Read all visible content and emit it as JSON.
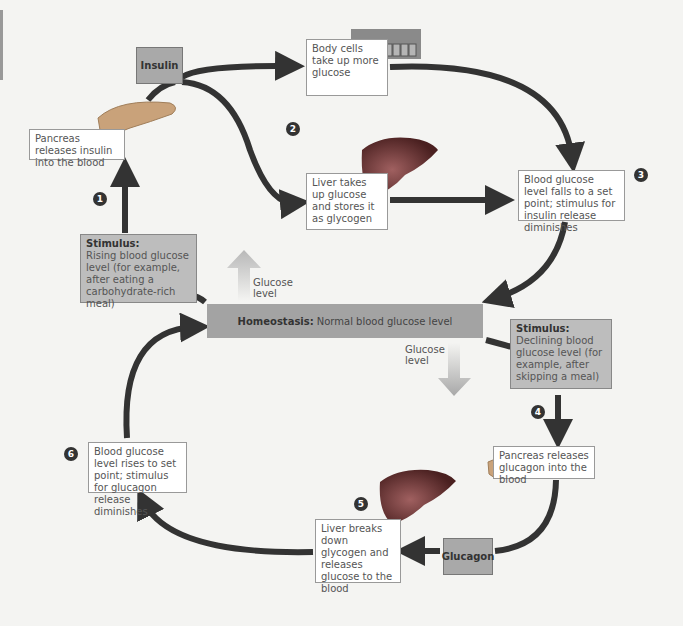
{
  "diagram": {
    "homeostasis": {
      "label_bold": "Homeostasis:",
      "label": "Normal blood glucose level"
    },
    "hormones": {
      "insulin": "Insulin",
      "glucagon": "Glucagon"
    },
    "glucose_level_up": "Glucose level",
    "glucose_level_down": "Glucose level",
    "steps": [
      {
        "num": "1",
        "text": "Pancreas releases insulin into the blood"
      },
      {
        "num": "2",
        "text_body": "Body cells take up more glucose",
        "text_liver": "Liver takes up glucose and stores it as glycogen"
      },
      {
        "num": "3",
        "text": "Blood glucose level falls to a set point; stimulus for insulin release diminishes"
      },
      {
        "num": "4",
        "text": "Pancreas releases glucagon into the blood"
      },
      {
        "num": "5",
        "text": "Liver breaks down glycogen and releases glucose to the blood"
      },
      {
        "num": "6",
        "text": "Blood glucose level rises to set point; stimulus for glucagon release diminishes"
      }
    ],
    "stimulus_rising": {
      "title": "Stimulus:",
      "text": "Rising blood glucose level (for example, after eating a carbohydrate-rich meal)"
    },
    "stimulus_declining": {
      "title": "Stimulus:",
      "text": "Declining blood glucose level (for example, after skipping a meal)"
    },
    "colors": {
      "arrow": "#333333",
      "stimulus_box": "#bdbdbd",
      "hormone_box": "#a9a9a9",
      "homeostasis_bar": "#a3a3a3",
      "organ": "#6b2a2a",
      "pancreas": "#c9a27a"
    }
  }
}
